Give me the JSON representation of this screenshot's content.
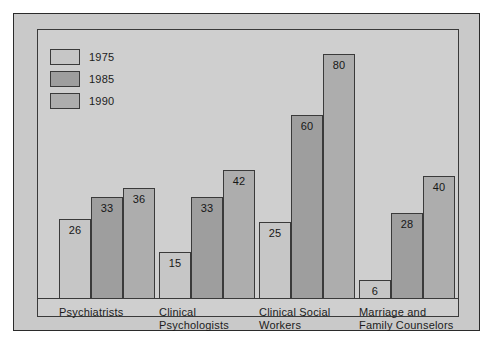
{
  "chart_data": {
    "type": "bar",
    "title": "",
    "xlabel": "",
    "ylabel": "",
    "ylim": [
      0,
      88
    ],
    "grid": false,
    "legend_position": "top-left",
    "categories": [
      "Psychiatrists",
      "Clinical\nPsychologists",
      "Clinical Social\nWorkers",
      "Marriage and\nFamily Counselors"
    ],
    "series": [
      {
        "name": "1975",
        "color": "#c6c6c6",
        "values": [
          26,
          15,
          25,
          6
        ]
      },
      {
        "name": "1985",
        "color": "#9e9e9e",
        "values": [
          33,
          33,
          60,
          28
        ]
      },
      {
        "name": "1990",
        "color": "#adadad",
        "values": [
          36,
          42,
          80,
          40
        ]
      }
    ]
  },
  "legend": {
    "items": [
      {
        "label": "1975",
        "color": "#c6c6c6"
      },
      {
        "label": "1985",
        "color": "#9e9e9e"
      },
      {
        "label": "1990",
        "color": "#adadad"
      }
    ]
  },
  "colors": {
    "page_background": "#ffffff",
    "figure_background": "#c9c9c9",
    "plot_background": "#cfcfcf",
    "border": "#3a3a3a",
    "text": "#1c1c1c"
  }
}
